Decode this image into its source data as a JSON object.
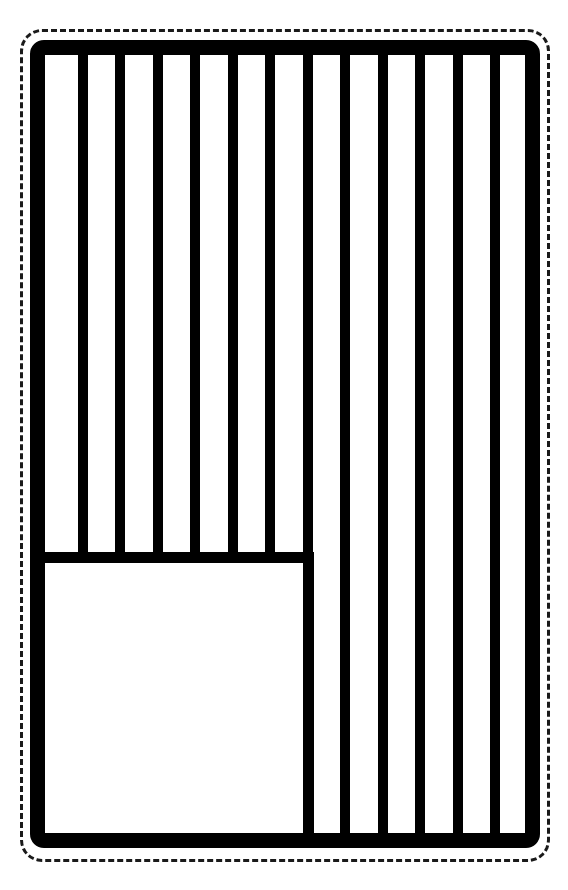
{
  "page": {
    "width": 568,
    "height": 890,
    "background_color": "#ffffff",
    "ink_color": "#000000",
    "paper_color": "#fefefe"
  },
  "cut_guide": {
    "label": "Cut along dashed line",
    "style": "dashed",
    "color": "#1a1a1a",
    "dash_width_px": 3,
    "corner_radius_px": 22,
    "rect": {
      "x": 20,
      "y": 29,
      "width": 530,
      "height": 833
    }
  },
  "flag_frame": {
    "label": "Flag outer border",
    "color": "#000000",
    "stroke_px": 15,
    "corner_radius_px": 14,
    "rect": {
      "x": 30,
      "y": 40,
      "width": 510,
      "height": 808
    }
  },
  "flag": {
    "orientation": "rotated-90-vertical-stripes",
    "stripe_count": 13,
    "divider_count": 12,
    "stripe_pitch_px": 37.5,
    "divider_width_px": 10,
    "stripe_fill": "#ffffff",
    "divider_fill": "#000000",
    "divider_positions_px": [
      33,
      70,
      108,
      145,
      183,
      220,
      258,
      295,
      333,
      370,
      408,
      445
    ],
    "stripes": [
      {
        "index": 1,
        "name": "stripe-1",
        "x": 0,
        "width": 33,
        "fill": "#ffffff"
      },
      {
        "index": 2,
        "name": "stripe-2",
        "x": 43,
        "width": 27,
        "fill": "#ffffff"
      },
      {
        "index": 3,
        "name": "stripe-3",
        "x": 80,
        "width": 28,
        "fill": "#ffffff"
      },
      {
        "index": 4,
        "name": "stripe-4",
        "x": 118,
        "width": 27,
        "fill": "#ffffff"
      },
      {
        "index": 5,
        "name": "stripe-5",
        "x": 155,
        "width": 28,
        "fill": "#ffffff"
      },
      {
        "index": 6,
        "name": "stripe-6",
        "x": 193,
        "width": 27,
        "fill": "#ffffff"
      },
      {
        "index": 7,
        "name": "stripe-7",
        "x": 230,
        "width": 28,
        "fill": "#ffffff"
      },
      {
        "index": 8,
        "name": "stripe-8",
        "x": 268,
        "width": 27,
        "fill": "#ffffff"
      },
      {
        "index": 9,
        "name": "stripe-9",
        "x": 305,
        "width": 28,
        "fill": "#ffffff"
      },
      {
        "index": 10,
        "name": "stripe-10",
        "x": 343,
        "width": 27,
        "fill": "#ffffff"
      },
      {
        "index": 11,
        "name": "stripe-11",
        "x": 380,
        "width": 28,
        "fill": "#ffffff"
      },
      {
        "index": 12,
        "name": "stripe-12",
        "x": 418,
        "width": 27,
        "fill": "#ffffff"
      },
      {
        "index": 13,
        "name": "stripe-13",
        "x": 455,
        "width": 25,
        "fill": "#ffffff"
      }
    ]
  },
  "canton": {
    "label": "Union / canton block",
    "fill": "#ffffff",
    "rule_color": "#000000",
    "rule_width_px": 11,
    "field": {
      "x": 0,
      "y": 508,
      "width": 258,
      "height": 270
    },
    "top_rule": {
      "x": 0,
      "y": 497,
      "width": 269,
      "height": 11
    },
    "right_rule": {
      "x": 258,
      "y": 497,
      "width": 11,
      "height": 281
    },
    "covers_stripes": [
      1,
      2,
      3,
      4,
      5,
      6,
      7,
      8
    ],
    "star_count": 0
  }
}
